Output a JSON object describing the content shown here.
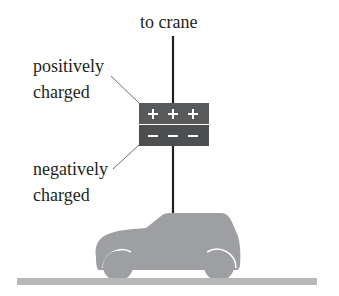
{
  "labels": {
    "to_crane": "to crane",
    "positive_line1": "positively",
    "positive_line2": "charged",
    "negative_line1": "negatively",
    "negative_line2": "charged"
  },
  "plates": {
    "positive_symbols": "+ + +",
    "negative_symbols": "– – –",
    "plate_color": "#58595b",
    "symbol_color": "#ffffff"
  },
  "colors": {
    "cable": "#231f20",
    "car": "#9d9fa2",
    "ground": "#b7b8ba",
    "text": "#231f20"
  }
}
